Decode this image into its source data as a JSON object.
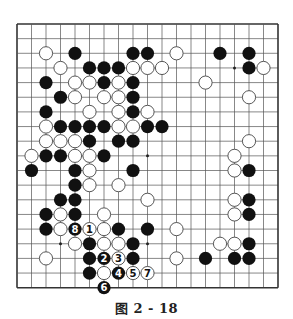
{
  "caption": "图 2 - 18",
  "board": {
    "size": 19,
    "origin_x": 17,
    "origin_y": 24,
    "spacing_x": 14.5,
    "spacing_y": 14.65,
    "stone_radius": 6.6,
    "line_color": "#555555",
    "border_color": "#333333",
    "black_color": "#111111",
    "white_fill": "#ffffff",
    "white_stroke": "#444444",
    "star_points": [
      [
        3,
        3
      ],
      [
        9,
        3
      ],
      [
        15,
        3
      ],
      [
        3,
        9
      ],
      [
        9,
        9
      ],
      [
        15,
        9
      ],
      [
        3,
        15
      ],
      [
        9,
        15
      ],
      [
        15,
        15
      ]
    ],
    "visible_star_points": [
      [
        15,
        3
      ],
      [
        9,
        9
      ],
      [
        3,
        15
      ],
      [
        9,
        15
      ]
    ],
    "stones": [
      {
        "c": "W",
        "x": 2,
        "y": 2
      },
      {
        "c": "B",
        "x": 4,
        "y": 2
      },
      {
        "c": "B",
        "x": 8,
        "y": 2
      },
      {
        "c": "B",
        "x": 9,
        "y": 2
      },
      {
        "c": "W",
        "x": 11,
        "y": 2
      },
      {
        "c": "B",
        "x": 14,
        "y": 2
      },
      {
        "c": "B",
        "x": 16,
        "y": 2
      },
      {
        "c": "W",
        "x": 3,
        "y": 3
      },
      {
        "c": "B",
        "x": 5,
        "y": 3
      },
      {
        "c": "B",
        "x": 6,
        "y": 3
      },
      {
        "c": "B",
        "x": 7,
        "y": 3
      },
      {
        "c": "W",
        "x": 8,
        "y": 3
      },
      {
        "c": "W",
        "x": 9,
        "y": 3
      },
      {
        "c": "W",
        "x": 10,
        "y": 3
      },
      {
        "c": "B",
        "x": 16,
        "y": 3
      },
      {
        "c": "W",
        "x": 17,
        "y": 3
      },
      {
        "c": "B",
        "x": 2,
        "y": 4
      },
      {
        "c": "W",
        "x": 4,
        "y": 4
      },
      {
        "c": "W",
        "x": 5,
        "y": 4
      },
      {
        "c": "B",
        "x": 6,
        "y": 4
      },
      {
        "c": "W",
        "x": 7,
        "y": 4
      },
      {
        "c": "B",
        "x": 8,
        "y": 4
      },
      {
        "c": "W",
        "x": 13,
        "y": 4
      },
      {
        "c": "B",
        "x": 3,
        "y": 5
      },
      {
        "c": "W",
        "x": 4,
        "y": 5
      },
      {
        "c": "W",
        "x": 6,
        "y": 5
      },
      {
        "c": "W",
        "x": 7,
        "y": 5
      },
      {
        "c": "B",
        "x": 8,
        "y": 5
      },
      {
        "c": "W",
        "x": 16,
        "y": 5
      },
      {
        "c": "B",
        "x": 2,
        "y": 6
      },
      {
        "c": "W",
        "x": 5,
        "y": 6
      },
      {
        "c": "W",
        "x": 7,
        "y": 6
      },
      {
        "c": "B",
        "x": 8,
        "y": 6
      },
      {
        "c": "W",
        "x": 9,
        "y": 6
      },
      {
        "c": "W",
        "x": 2,
        "y": 7
      },
      {
        "c": "B",
        "x": 3,
        "y": 7
      },
      {
        "c": "B",
        "x": 4,
        "y": 7
      },
      {
        "c": "B",
        "x": 5,
        "y": 7
      },
      {
        "c": "B",
        "x": 6,
        "y": 7
      },
      {
        "c": "W",
        "x": 7,
        "y": 7
      },
      {
        "c": "W",
        "x": 8,
        "y": 7
      },
      {
        "c": "B",
        "x": 9,
        "y": 7
      },
      {
        "c": "B",
        "x": 10,
        "y": 7
      },
      {
        "c": "W",
        "x": 2,
        "y": 8
      },
      {
        "c": "W",
        "x": 3,
        "y": 8
      },
      {
        "c": "W",
        "x": 4,
        "y": 8
      },
      {
        "c": "B",
        "x": 5,
        "y": 8
      },
      {
        "c": "B",
        "x": 7,
        "y": 8
      },
      {
        "c": "B",
        "x": 8,
        "y": 8
      },
      {
        "c": "W",
        "x": 16,
        "y": 8
      },
      {
        "c": "W",
        "x": 1,
        "y": 9
      },
      {
        "c": "B",
        "x": 2,
        "y": 9
      },
      {
        "c": "B",
        "x": 3,
        "y": 9
      },
      {
        "c": "W",
        "x": 4,
        "y": 9
      },
      {
        "c": "W",
        "x": 5,
        "y": 9
      },
      {
        "c": "B",
        "x": 6,
        "y": 9
      },
      {
        "c": "W",
        "x": 15,
        "y": 9
      },
      {
        "c": "B",
        "x": 1,
        "y": 10
      },
      {
        "c": "B",
        "x": 4,
        "y": 10
      },
      {
        "c": "W",
        "x": 5,
        "y": 10
      },
      {
        "c": "B",
        "x": 8,
        "y": 10
      },
      {
        "c": "W",
        "x": 15,
        "y": 10
      },
      {
        "c": "B",
        "x": 16,
        "y": 10
      },
      {
        "c": "B",
        "x": 4,
        "y": 11
      },
      {
        "c": "W",
        "x": 5,
        "y": 11
      },
      {
        "c": "W",
        "x": 7,
        "y": 11
      },
      {
        "c": "B",
        "x": 3,
        "y": 12
      },
      {
        "c": "B",
        "x": 4,
        "y": 12
      },
      {
        "c": "W",
        "x": 9,
        "y": 12
      },
      {
        "c": "W",
        "x": 15,
        "y": 12
      },
      {
        "c": "B",
        "x": 16,
        "y": 12
      },
      {
        "c": "B",
        "x": 2,
        "y": 13
      },
      {
        "c": "W",
        "x": 3,
        "y": 13
      },
      {
        "c": "B",
        "x": 4,
        "y": 13
      },
      {
        "c": "W",
        "x": 6,
        "y": 13
      },
      {
        "c": "W",
        "x": 15,
        "y": 13
      },
      {
        "c": "B",
        "x": 16,
        "y": 13
      },
      {
        "c": "B",
        "x": 2,
        "y": 14
      },
      {
        "c": "W",
        "x": 3,
        "y": 14
      },
      {
        "c": "B",
        "x": 4,
        "y": 14,
        "n": "8"
      },
      {
        "c": "W",
        "x": 5,
        "y": 14,
        "n": "1"
      },
      {
        "c": "W",
        "x": 6,
        "y": 14
      },
      {
        "c": "B",
        "x": 7,
        "y": 14
      },
      {
        "c": "B",
        "x": 9,
        "y": 14
      },
      {
        "c": "W",
        "x": 11,
        "y": 14
      },
      {
        "c": "W",
        "x": 4,
        "y": 15
      },
      {
        "c": "B",
        "x": 5,
        "y": 15
      },
      {
        "c": "W",
        "x": 6,
        "y": 15
      },
      {
        "c": "W",
        "x": 7,
        "y": 15
      },
      {
        "c": "B",
        "x": 8,
        "y": 15
      },
      {
        "c": "W",
        "x": 14,
        "y": 15
      },
      {
        "c": "W",
        "x": 15,
        "y": 15
      },
      {
        "c": "B",
        "x": 16,
        "y": 15
      },
      {
        "c": "W",
        "x": 2,
        "y": 16
      },
      {
        "c": "B",
        "x": 5,
        "y": 16
      },
      {
        "c": "B",
        "x": 6,
        "y": 16,
        "n": "2"
      },
      {
        "c": "W",
        "x": 7,
        "y": 16,
        "n": "3"
      },
      {
        "c": "B",
        "x": 8,
        "y": 16
      },
      {
        "c": "W",
        "x": 11,
        "y": 16
      },
      {
        "c": "B",
        "x": 13,
        "y": 16
      },
      {
        "c": "B",
        "x": 15,
        "y": 16
      },
      {
        "c": "B",
        "x": 16,
        "y": 16
      },
      {
        "c": "B",
        "x": 5,
        "y": 17
      },
      {
        "c": "W",
        "x": 6,
        "y": 17
      },
      {
        "c": "B",
        "x": 7,
        "y": 17,
        "n": "4"
      },
      {
        "c": "W",
        "x": 8,
        "y": 17,
        "n": "5"
      },
      {
        "c": "W",
        "x": 9,
        "y": 17,
        "n": "7"
      },
      {
        "c": "B",
        "x": 6,
        "y": 18,
        "n": "6"
      }
    ]
  }
}
